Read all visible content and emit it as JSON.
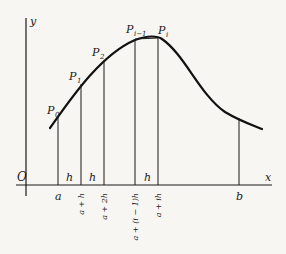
{
  "figure": {
    "axes": {
      "origin_label": "O",
      "x_label": "x",
      "y_label": "y"
    },
    "points": [
      {
        "name": "P0",
        "base": "P",
        "sub": "0"
      },
      {
        "name": "P1",
        "base": "P",
        "sub": "1"
      },
      {
        "name": "P2",
        "base": "P",
        "sub": "2"
      },
      {
        "name": "Pi-1",
        "base": "P",
        "sub": "i−1"
      },
      {
        "name": "Pi",
        "base": "P",
        "sub": "i"
      }
    ],
    "strip_width_labels": [
      "h",
      "h",
      "h"
    ],
    "x_ticks": [
      "a",
      "a + h",
      "a + 2h",
      "a + (i − 1)h",
      "a + ih",
      "b"
    ],
    "colors": {
      "background": "#f7f6f2",
      "ink": "#1a1a1a"
    }
  }
}
